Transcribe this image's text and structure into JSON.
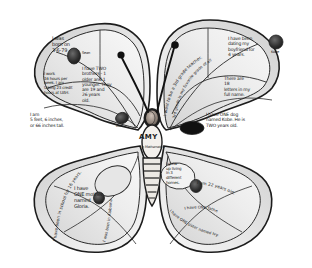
{
  "artwork": {
    "title": "All About Me Butterfly",
    "subject_name": "AMY",
    "body_subtitle": "in Mathematics",
    "background_color": "#ffffff",
    "ink_color": "#1c1c1c",
    "wing_fill_light": "#efefef",
    "wing_fill_mid": "#d8d8d8",
    "wing_fill_dark": "#bcbcbc",
    "photo_fill": "#2b2b2b"
  },
  "antennae": {
    "left_tip": "antenna-knob",
    "right_tip": "antenna-knob"
  },
  "facts": {
    "birth": "I was\nborn on\n3-6-79",
    "work": "I work\n16 hours per\nweek. I am\ntaking 23 credit\nhours at UAH.",
    "brothers": "I have TWO\nbrothers - 1\nolder and 1\nyounger. They\nare 19 and\n26 years\nold.",
    "height": "I am\n5 feet, 6 inches,\nor 66 inches tall.",
    "boyfriend": "I have been\ndating my\nboyfriend for\n4 years.",
    "letters": "There are\n18\nletters in my\nfull name.",
    "dog": "I have ONE dog\nnamed Kobe. He is\nTWO years old.",
    "teacher_curved": "I want to be a 3rd grade teacher.",
    "teacher_curved2": "3rd grade is my favorite grade of all.",
    "mother": "I have\nONE mother\nnamed\nGloria.",
    "school_curved": "I have been in school for 16 years.",
    "years_school_curved": "I was born in Alabama.",
    "homes": "I grew\nup living\nin 3\ndifferent\nhomes.",
    "age_curved": "I am 22 years old.",
    "father": "I have ONE father named Joe.",
    "sister_curved": "I have ONE sister named Ivy."
  },
  "photos": [
    {
      "id": "photo-sean",
      "label": "Sean"
    },
    {
      "id": "photo-dad",
      "label": "Dad"
    },
    {
      "id": "photo-kobe",
      "label": "Kobe"
    },
    {
      "id": "photo-amy",
      "label": "Amy"
    },
    {
      "id": "photo-mom",
      "label": "Mom"
    },
    {
      "id": "photo-joe",
      "label": "Joe"
    },
    {
      "id": "photo-dog",
      "label": ""
    }
  ]
}
